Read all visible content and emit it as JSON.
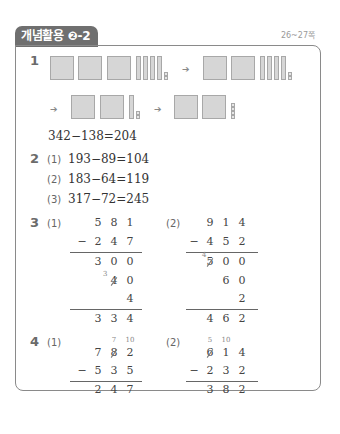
{
  "header": {
    "title": "개념활용 ❷-2",
    "page_ref": "26~27쪽"
  },
  "problem1": {
    "number": "1",
    "arrow": "➔",
    "equation": "342−138=204",
    "blocks": [
      {
        "hundreds": 3,
        "tens": 4,
        "ones": 2
      },
      {
        "hundreds": 2,
        "tens": 4,
        "ones": 2
      },
      {
        "hundreds": 2,
        "tens": 1,
        "ones": 2
      },
      {
        "hundreds": 2,
        "tens": 0,
        "ones": 4
      }
    ]
  },
  "problem2": {
    "number": "2",
    "items": [
      {
        "label": "(1)",
        "equation": "193−89=104"
      },
      {
        "label": "(2)",
        "equation": "183−64=119"
      },
      {
        "label": "(3)",
        "equation": "317−72=245"
      }
    ]
  },
  "problem3": {
    "number": "3",
    "parts": [
      {
        "label": "(1)",
        "top": [
          "5",
          "8",
          "1"
        ],
        "minus": "−",
        "sub": [
          "2",
          "4",
          "7"
        ],
        "partials": [
          [
            "3",
            "0",
            "0"
          ],
          [
            "",
            "4",
            "0"
          ],
          [
            "",
            "",
            "4"
          ]
        ],
        "borrow_mark": "3",
        "result": [
          "3",
          "3",
          "4"
        ]
      },
      {
        "label": "(2)",
        "top": [
          "9",
          "1",
          "4"
        ],
        "minus": "−",
        "sub": [
          "4",
          "5",
          "2"
        ],
        "partials": [
          [
            "5",
            "0",
            "0"
          ],
          [
            "",
            "6",
            "0"
          ],
          [
            "",
            "",
            "2"
          ]
        ],
        "borrow_mark": "4",
        "result": [
          "4",
          "6",
          "2"
        ]
      }
    ]
  },
  "problem4": {
    "number": "4",
    "parts": [
      {
        "label": "(1)",
        "carry": [
          "",
          "7",
          "10"
        ],
        "top": [
          "7",
          "8",
          "2"
        ],
        "minus": "−",
        "sub": [
          "5",
          "3",
          "5"
        ],
        "result": [
          "2",
          "4",
          "7"
        ]
      },
      {
        "label": "(2)",
        "carry": [
          "5",
          "10",
          ""
        ],
        "top": [
          "6",
          "1",
          "4"
        ],
        "minus": "−",
        "sub": [
          "2",
          "3",
          "2"
        ],
        "result": [
          "3",
          "8",
          "2"
        ]
      }
    ]
  }
}
